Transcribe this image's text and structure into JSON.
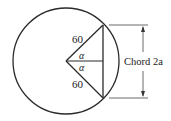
{
  "diagram": {
    "type": "geometry",
    "labels": {
      "upper_radius": "60",
      "lower_radius": "60",
      "upper_angle": "α",
      "lower_angle": "α",
      "chord": "Chord 2a"
    },
    "colors": {
      "stroke": "#2a2a2a",
      "background": "#ffffff"
    }
  }
}
